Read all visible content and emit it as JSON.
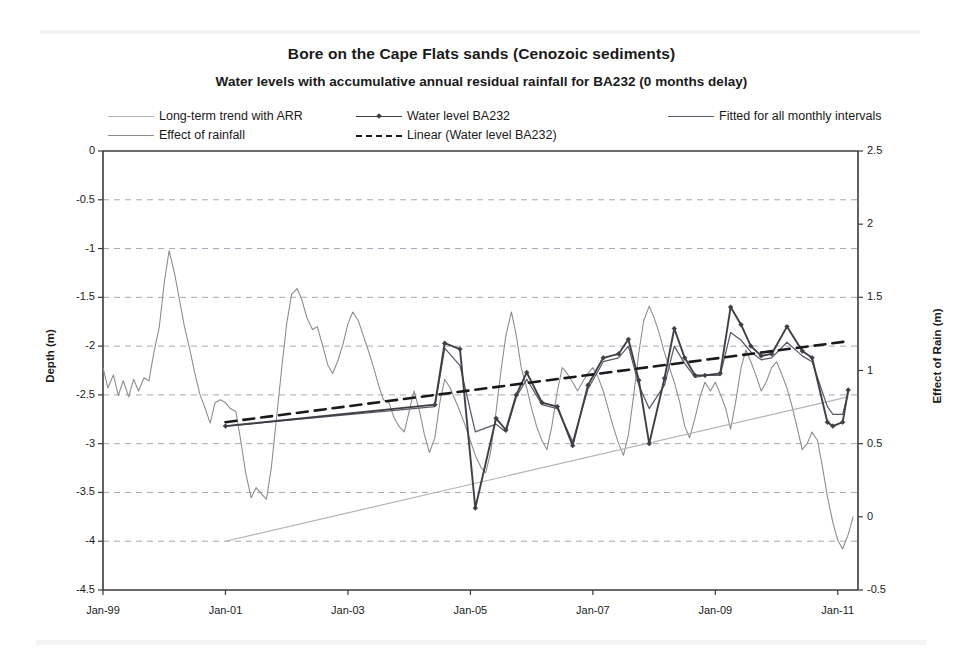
{
  "chart_data": {
    "type": "line",
    "title": "Bore on the Cape Flats sands (Cenozoic sediments)",
    "subtitle": "Water levels with accumulative annual residual rainfall for BA232 (0 months delay)",
    "xlabel": "",
    "ylabel": "Depth (m)",
    "y2label": "Effect of Rain (m)",
    "grid": true,
    "legend_position": "top",
    "ylim": [
      -4.5,
      0
    ],
    "y2lim": [
      -0.5,
      2.5
    ],
    "yticks": [
      "0",
      "-0.5",
      "-1",
      "-1.5",
      "-2",
      "-2.5",
      "-3",
      "-3.5",
      "-4",
      "-4.5"
    ],
    "ytick_values": [
      0,
      -0.5,
      -1,
      -1.5,
      -2,
      -2.5,
      -3,
      -3.5,
      -4,
      -4.5
    ],
    "y2ticks": [
      "2.5",
      "2",
      "1.5",
      "1",
      "0.5",
      "0",
      "-0.5"
    ],
    "y2tick_values": [
      2.5,
      2,
      1.5,
      1,
      0.5,
      0,
      -0.5
    ],
    "xticks": [
      "Jan-99",
      "Jan-01",
      "Jan-03",
      "Jan-05",
      "Jan-07",
      "Jan-09",
      "Jan-11"
    ],
    "xtick_values": [
      1999.0,
      2001.0,
      2003.0,
      2005.0,
      2007.0,
      2009.0,
      2011.0
    ],
    "xlim": [
      1999.0,
      2011.33
    ],
    "legend": [
      {
        "label": "Long-term trend with ARR",
        "color": "#b4b4b4",
        "style": "solid",
        "marker": false
      },
      {
        "label": "Effect of rainfall",
        "color": "#8a8a8a",
        "style": "solid",
        "marker": false
      },
      {
        "label": "Water level BA232",
        "color": "#3f3f46",
        "style": "solid",
        "marker": true
      },
      {
        "label": "Linear (Water level BA232)",
        "color": "#1a1a1a",
        "style": "dashed",
        "marker": false
      },
      {
        "label": "Fitted for all monthly intervals",
        "color": "#5a5a66",
        "style": "solid",
        "marker": false
      }
    ],
    "series": [
      {
        "name": "Effect of rainfall",
        "axis": "right",
        "color": "#8a8a8a",
        "style": "solid",
        "points": [
          [
            1999.0,
            1.02
          ],
          [
            1999.08,
            0.88
          ],
          [
            1999.17,
            0.97
          ],
          [
            1999.25,
            0.83
          ],
          [
            1999.33,
            0.93
          ],
          [
            1999.42,
            0.82
          ],
          [
            1999.5,
            0.94
          ],
          [
            1999.58,
            0.86
          ],
          [
            1999.67,
            0.95
          ],
          [
            1999.75,
            0.93
          ],
          [
            1999.83,
            1.12
          ],
          [
            1999.92,
            1.3
          ],
          [
            2000.0,
            1.6
          ],
          [
            2000.08,
            1.82
          ],
          [
            2000.17,
            1.66
          ],
          [
            2000.25,
            1.48
          ],
          [
            2000.33,
            1.3
          ],
          [
            2000.42,
            1.14
          ],
          [
            2000.5,
            0.98
          ],
          [
            2000.58,
            0.84
          ],
          [
            2000.67,
            0.74
          ],
          [
            2000.75,
            0.64
          ],
          [
            2000.83,
            0.78
          ],
          [
            2000.92,
            0.8
          ],
          [
            2001.0,
            0.78
          ],
          [
            2001.08,
            0.74
          ],
          [
            2001.17,
            0.72
          ],
          [
            2001.25,
            0.52
          ],
          [
            2001.33,
            0.3
          ],
          [
            2001.42,
            0.13
          ],
          [
            2001.5,
            0.2
          ],
          [
            2001.58,
            0.16
          ],
          [
            2001.67,
            0.12
          ],
          [
            2001.75,
            0.34
          ],
          [
            2001.83,
            0.66
          ],
          [
            2001.92,
            1.02
          ],
          [
            2002.0,
            1.32
          ],
          [
            2002.08,
            1.52
          ],
          [
            2002.17,
            1.56
          ],
          [
            2002.25,
            1.48
          ],
          [
            2002.33,
            1.36
          ],
          [
            2002.42,
            1.28
          ],
          [
            2002.5,
            1.3
          ],
          [
            2002.58,
            1.18
          ],
          [
            2002.67,
            1.04
          ],
          [
            2002.75,
            0.98
          ],
          [
            2002.83,
            1.06
          ],
          [
            2002.92,
            1.18
          ],
          [
            2003.0,
            1.32
          ],
          [
            2003.08,
            1.4
          ],
          [
            2003.17,
            1.34
          ],
          [
            2003.25,
            1.24
          ],
          [
            2003.33,
            1.14
          ],
          [
            2003.42,
            1.02
          ],
          [
            2003.5,
            0.9
          ],
          [
            2003.58,
            0.8
          ],
          [
            2003.67,
            0.78
          ],
          [
            2003.75,
            0.68
          ],
          [
            2003.83,
            0.62
          ],
          [
            2003.92,
            0.58
          ],
          [
            2004.0,
            0.72
          ],
          [
            2004.08,
            0.86
          ],
          [
            2004.17,
            0.72
          ],
          [
            2004.25,
            0.56
          ],
          [
            2004.33,
            0.44
          ],
          [
            2004.42,
            0.54
          ],
          [
            2004.5,
            0.78
          ],
          [
            2004.58,
            0.94
          ],
          [
            2004.67,
            0.88
          ],
          [
            2004.75,
            0.8
          ],
          [
            2004.83,
            0.72
          ],
          [
            2004.92,
            0.62
          ],
          [
            2005.0,
            0.52
          ],
          [
            2005.08,
            0.42
          ],
          [
            2005.17,
            0.34
          ],
          [
            2005.25,
            0.3
          ],
          [
            2005.33,
            0.44
          ],
          [
            2005.42,
            0.72
          ],
          [
            2005.5,
            1.0
          ],
          [
            2005.58,
            1.24
          ],
          [
            2005.67,
            1.4
          ],
          [
            2005.75,
            1.24
          ],
          [
            2005.83,
            1.02
          ],
          [
            2005.92,
            0.88
          ],
          [
            2006.0,
            0.74
          ],
          [
            2006.08,
            0.62
          ],
          [
            2006.17,
            0.52
          ],
          [
            2006.25,
            0.46
          ],
          [
            2006.33,
            0.62
          ],
          [
            2006.42,
            0.86
          ],
          [
            2006.5,
            1.02
          ],
          [
            2006.58,
            0.98
          ],
          [
            2006.67,
            0.92
          ],
          [
            2006.75,
            0.86
          ],
          [
            2006.83,
            0.92
          ],
          [
            2006.92,
            0.98
          ],
          [
            2007.0,
            1.02
          ],
          [
            2007.08,
            0.96
          ],
          [
            2007.17,
            0.86
          ],
          [
            2007.25,
            0.74
          ],
          [
            2007.33,
            0.62
          ],
          [
            2007.42,
            0.5
          ],
          [
            2007.5,
            0.42
          ],
          [
            2007.58,
            0.56
          ],
          [
            2007.67,
            0.84
          ],
          [
            2007.75,
            1.12
          ],
          [
            2007.83,
            1.34
          ],
          [
            2007.92,
            1.44
          ],
          [
            2008.0,
            1.36
          ],
          [
            2008.08,
            1.26
          ],
          [
            2008.17,
            1.12
          ],
          [
            2008.25,
            1.02
          ],
          [
            2008.33,
            0.92
          ],
          [
            2008.42,
            0.78
          ],
          [
            2008.5,
            0.62
          ],
          [
            2008.58,
            0.54
          ],
          [
            2008.67,
            0.68
          ],
          [
            2008.75,
            0.82
          ],
          [
            2008.83,
            0.92
          ],
          [
            2008.92,
            0.86
          ],
          [
            2009.0,
            0.92
          ],
          [
            2009.08,
            0.84
          ],
          [
            2009.17,
            0.74
          ],
          [
            2009.25,
            0.6
          ],
          [
            2009.33,
            0.78
          ],
          [
            2009.42,
            1.02
          ],
          [
            2009.5,
            1.14
          ],
          [
            2009.58,
            1.06
          ],
          [
            2009.67,
            0.96
          ],
          [
            2009.75,
            0.86
          ],
          [
            2009.83,
            0.92
          ],
          [
            2009.92,
            1.02
          ],
          [
            2010.0,
            1.06
          ],
          [
            2010.08,
            0.98
          ],
          [
            2010.17,
            0.88
          ],
          [
            2010.25,
            0.76
          ],
          [
            2010.33,
            0.62
          ],
          [
            2010.42,
            0.46
          ],
          [
            2010.5,
            0.5
          ],
          [
            2010.58,
            0.58
          ],
          [
            2010.67,
            0.52
          ],
          [
            2010.75,
            0.34
          ],
          [
            2010.83,
            0.14
          ],
          [
            2010.92,
            -0.04
          ],
          [
            2011.0,
            -0.16
          ],
          [
            2011.08,
            -0.22
          ],
          [
            2011.17,
            -0.12
          ],
          [
            2011.25,
            0.0
          ]
        ]
      },
      {
        "name": "Long-term trend with ARR",
        "axis": "left",
        "color": "#b4b4b4",
        "style": "solid",
        "points": [
          [
            2001.0,
            -4.0
          ],
          [
            2011.17,
            -2.52
          ]
        ]
      },
      {
        "name": "Water level BA232",
        "axis": "left",
        "color": "#3f3f46",
        "style": "solid",
        "marker": "diamond",
        "points": [
          [
            2001.0,
            -2.82
          ],
          [
            2004.42,
            -2.6
          ],
          [
            2004.58,
            -1.97
          ],
          [
            2004.83,
            -2.03
          ],
          [
            2005.08,
            -3.66
          ],
          [
            2005.42,
            -2.74
          ],
          [
            2005.58,
            -2.86
          ],
          [
            2005.75,
            -2.5
          ],
          [
            2005.92,
            -2.27
          ],
          [
            2006.17,
            -2.58
          ],
          [
            2006.42,
            -2.62
          ],
          [
            2006.67,
            -3.02
          ],
          [
            2006.92,
            -2.4
          ],
          [
            2007.17,
            -2.12
          ],
          [
            2007.42,
            -2.08
          ],
          [
            2007.58,
            -1.93
          ],
          [
            2007.75,
            -2.35
          ],
          [
            2007.92,
            -3.0
          ],
          [
            2008.17,
            -2.33
          ],
          [
            2008.33,
            -1.82
          ],
          [
            2008.5,
            -2.12
          ],
          [
            2008.67,
            -2.3
          ],
          [
            2008.83,
            -2.3
          ],
          [
            2009.08,
            -2.28
          ],
          [
            2009.25,
            -1.6
          ],
          [
            2009.42,
            -1.78
          ],
          [
            2009.58,
            -2.0
          ],
          [
            2009.75,
            -2.1
          ],
          [
            2009.92,
            -2.08
          ],
          [
            2010.17,
            -1.8
          ],
          [
            2010.42,
            -2.05
          ],
          [
            2010.58,
            -2.12
          ],
          [
            2010.83,
            -2.78
          ],
          [
            2010.92,
            -2.82
          ],
          [
            2011.08,
            -2.78
          ],
          [
            2011.17,
            -2.45
          ]
        ]
      },
      {
        "name": "Fitted for all monthly intervals",
        "axis": "left",
        "color": "#5a5a66",
        "style": "solid",
        "points": [
          [
            2001.0,
            -2.82
          ],
          [
            2004.42,
            -2.62
          ],
          [
            2004.58,
            -2.02
          ],
          [
            2004.83,
            -2.2
          ],
          [
            2005.08,
            -2.88
          ],
          [
            2005.42,
            -2.8
          ],
          [
            2005.58,
            -2.88
          ],
          [
            2005.75,
            -2.52
          ],
          [
            2005.92,
            -2.34
          ],
          [
            2006.17,
            -2.6
          ],
          [
            2006.42,
            -2.64
          ],
          [
            2006.67,
            -2.98
          ],
          [
            2006.92,
            -2.44
          ],
          [
            2007.17,
            -2.16
          ],
          [
            2007.42,
            -2.12
          ],
          [
            2007.58,
            -2.0
          ],
          [
            2007.75,
            -2.4
          ],
          [
            2007.92,
            -2.64
          ],
          [
            2008.17,
            -2.4
          ],
          [
            2008.33,
            -2.0
          ],
          [
            2008.5,
            -2.18
          ],
          [
            2008.67,
            -2.32
          ],
          [
            2008.83,
            -2.3
          ],
          [
            2009.08,
            -2.3
          ],
          [
            2009.25,
            -1.86
          ],
          [
            2009.42,
            -1.94
          ],
          [
            2009.58,
            -2.06
          ],
          [
            2009.75,
            -2.14
          ],
          [
            2009.92,
            -2.12
          ],
          [
            2010.17,
            -1.96
          ],
          [
            2010.42,
            -2.1
          ],
          [
            2010.58,
            -2.16
          ],
          [
            2010.83,
            -2.62
          ],
          [
            2010.92,
            -2.7
          ],
          [
            2011.08,
            -2.7
          ],
          [
            2011.17,
            -2.48
          ]
        ]
      },
      {
        "name": "Linear (Water level BA232)",
        "axis": "left",
        "color": "#1a1a1a",
        "style": "dashed",
        "points": [
          [
            2001.0,
            -2.78
          ],
          [
            2011.17,
            -1.95
          ]
        ]
      }
    ]
  }
}
